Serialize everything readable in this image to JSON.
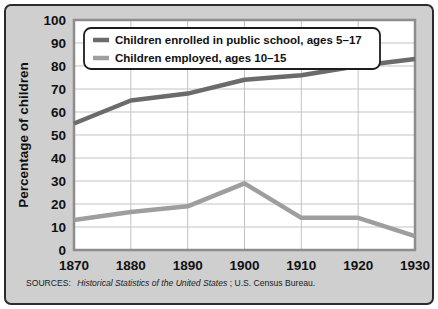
{
  "chart_data": {
    "type": "line",
    "title": "",
    "xlabel": "",
    "ylabel": "Percentage of children",
    "x": [
      1870,
      1880,
      1890,
      1900,
      1910,
      1920,
      1930
    ],
    "xticklabels": [
      "1870",
      "1880",
      "1890",
      "1900",
      "1910",
      "1920",
      "1930"
    ],
    "yticklabels": [
      "0",
      "10",
      "20",
      "30",
      "40",
      "50",
      "60",
      "70",
      "80",
      "90",
      "100"
    ],
    "yticks": [
      0,
      10,
      20,
      30,
      40,
      50,
      60,
      70,
      80,
      90,
      100
    ],
    "ylim": [
      0,
      100
    ],
    "xlim": [
      1870,
      1930
    ],
    "grid": true,
    "legend_position": "top-left-inside",
    "series": [
      {
        "name": "Children enrolled in public school, ages 5–17",
        "color": "#6b6b6b",
        "values": [
          55,
          65,
          68,
          74,
          76,
          80,
          83
        ]
      },
      {
        "name": "Children employed, ages 10–15",
        "color": "#9e9e9e",
        "values": [
          13,
          16.5,
          19,
          29,
          14,
          14,
          6
        ]
      }
    ],
    "source_prefix": "SOURCES:",
    "source_italic": "Historical Statistics of the United States",
    "source_suffix": "; U.S. Census Bureau."
  },
  "colors": {
    "card_background": "#cfcfcf",
    "card_border": "#2b2b2b",
    "plot_background": "#ffffff",
    "gridline": "#c3c3c3",
    "series_school": "#6b6b6b",
    "series_employed": "#9e9e9e"
  }
}
